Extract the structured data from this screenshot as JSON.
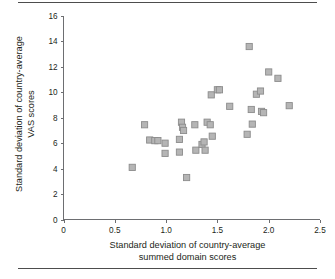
{
  "figure": {
    "type": "scatter-plot",
    "top_rule": "horizontal-rule",
    "bottom_rule": "horizontal-rule"
  },
  "chart_data": {
    "type": "scatter",
    "title": "",
    "xlabel_line1": "Standard deviation of country-average",
    "xlabel_line2": "summed domain scores",
    "ylabel_line1": "Standard deviation of country-average",
    "ylabel_line2": "VAS scores",
    "xlim": [
      0,
      2.5
    ],
    "ylim": [
      0,
      16
    ],
    "xticks": [
      0,
      0.5,
      1.0,
      1.5,
      2.0,
      2.5
    ],
    "xtick_labels": [
      "0",
      "0.5",
      "1.0",
      "1.5",
      "2.0",
      "2.5"
    ],
    "yticks": [
      0,
      2,
      4,
      6,
      8,
      10,
      12,
      14,
      16
    ],
    "ytick_labels": [
      "0",
      "2",
      "4",
      "6",
      "8",
      "10",
      "12",
      "14",
      "16"
    ],
    "grid": false,
    "legend": null,
    "marker": "square",
    "marker_fill": "#b5b5b5",
    "marker_edge": "#8c8c8c",
    "points": [
      {
        "x": 0.67,
        "y": 4.1
      },
      {
        "x": 0.79,
        "y": 7.45
      },
      {
        "x": 0.84,
        "y": 6.25
      },
      {
        "x": 0.89,
        "y": 6.2
      },
      {
        "x": 0.92,
        "y": 6.2
      },
      {
        "x": 0.99,
        "y": 6.0
      },
      {
        "x": 0.99,
        "y": 5.2
      },
      {
        "x": 1.13,
        "y": 6.3
      },
      {
        "x": 1.13,
        "y": 5.3
      },
      {
        "x": 1.15,
        "y": 7.65
      },
      {
        "x": 1.16,
        "y": 7.25
      },
      {
        "x": 1.17,
        "y": 7.0
      },
      {
        "x": 1.2,
        "y": 3.3
      },
      {
        "x": 1.28,
        "y": 7.45
      },
      {
        "x": 1.29,
        "y": 5.45
      },
      {
        "x": 1.35,
        "y": 5.9
      },
      {
        "x": 1.37,
        "y": 6.1
      },
      {
        "x": 1.38,
        "y": 5.45
      },
      {
        "x": 1.4,
        "y": 7.65
      },
      {
        "x": 1.43,
        "y": 7.45
      },
      {
        "x": 1.44,
        "y": 9.8
      },
      {
        "x": 1.45,
        "y": 6.55
      },
      {
        "x": 1.5,
        "y": 10.2
      },
      {
        "x": 1.52,
        "y": 10.2
      },
      {
        "x": 1.62,
        "y": 8.9
      },
      {
        "x": 1.79,
        "y": 6.7
      },
      {
        "x": 1.81,
        "y": 13.6
      },
      {
        "x": 1.83,
        "y": 8.65
      },
      {
        "x": 1.84,
        "y": 7.5
      },
      {
        "x": 1.88,
        "y": 9.85
      },
      {
        "x": 1.92,
        "y": 10.1
      },
      {
        "x": 1.93,
        "y": 8.5
      },
      {
        "x": 1.95,
        "y": 8.4
      },
      {
        "x": 2.0,
        "y": 11.6
      },
      {
        "x": 2.09,
        "y": 11.1
      },
      {
        "x": 2.2,
        "y": 8.95
      }
    ]
  }
}
